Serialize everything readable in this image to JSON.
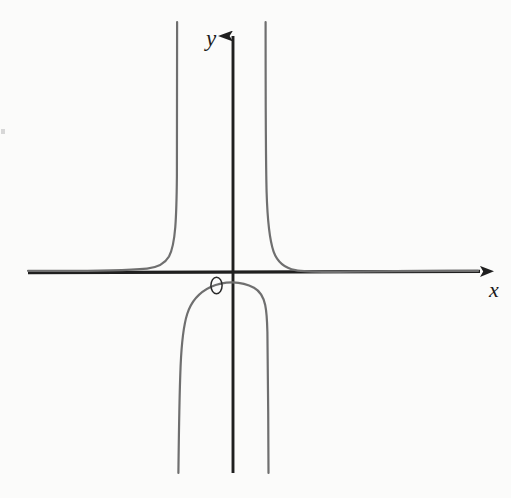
{
  "figure": {
    "background_color": "#fbfbfa",
    "axis_color": "#1f1f1f",
    "curve_color": "#6f6f6f",
    "label_color": "#1c1c1c",
    "width": 511,
    "height": 498
  },
  "labels": {
    "x_axis": "x",
    "y_axis": "y",
    "origin": "O"
  },
  "chart_data": {
    "type": "line",
    "title": "",
    "subtitle": "",
    "xlabel": "x",
    "ylabel": "y",
    "legend": [],
    "legend_position": "none",
    "grid": false,
    "annotations": [
      "O"
    ],
    "axes": {
      "x_axis_y_pixel": 272,
      "y_axis_x_pixel": 233,
      "x_axis_start_pixel": 28,
      "x_axis_end_pixel": 488,
      "y_axis_top_pixel": 22,
      "y_axis_bottom_pixel": 473,
      "x_arrow": "right",
      "y_arrow": "up",
      "xlim": [
        -5.2,
        3.1
      ],
      "ylim": [
        -3.6,
        3.1
      ],
      "origin_pixel": [
        233,
        272
      ]
    },
    "asymptotes": {
      "vertical": [
        -1.0,
        0.55
      ],
      "vertical_pixels": [
        177,
        266
      ],
      "horizontal": [
        0.0
      ],
      "horizontal_pixels": [
        272
      ]
    },
    "branches": [
      {
        "name": "left-outer-branch",
        "region": "x < left asymptote",
        "points_pixel": [
          [
            28,
            271
          ],
          [
            70,
            271
          ],
          [
            110,
            270
          ],
          [
            140,
            269
          ],
          [
            156,
            267
          ],
          [
            164,
            263
          ],
          [
            169,
            256
          ],
          [
            172,
            244
          ],
          [
            174,
            226
          ],
          [
            175.5,
            196
          ],
          [
            176.5,
            150
          ],
          [
            177,
            95
          ],
          [
            177,
            22
          ]
        ]
      },
      {
        "name": "middle-branch",
        "region": "between the two vertical asymptotes",
        "points_pixel": [
          [
            178,
            473
          ],
          [
            180,
            420
          ],
          [
            181,
            380
          ],
          [
            182,
            350
          ],
          [
            184,
            330
          ],
          [
            188,
            312
          ],
          [
            195,
            299
          ],
          [
            205,
            290
          ],
          [
            216,
            285
          ],
          [
            228,
            283
          ],
          [
            240,
            284
          ],
          [
            251,
            289
          ],
          [
            259,
            298
          ],
          [
            263,
            311
          ],
          [
            265,
            330
          ],
          [
            266,
            360
          ],
          [
            266.5,
            410
          ],
          [
            267,
            473
          ]
        ]
      },
      {
        "name": "right-outer-branch",
        "region": "x > right asymptote",
        "points_pixel": [
          [
            266,
            22
          ],
          [
            266,
            100
          ],
          [
            266.5,
            155
          ],
          [
            268,
            200
          ],
          [
            270,
            225
          ],
          [
            273,
            242
          ],
          [
            279,
            254
          ],
          [
            288,
            263
          ],
          [
            300,
            268
          ],
          [
            320,
            270
          ],
          [
            350,
            271
          ],
          [
            400,
            271
          ],
          [
            460,
            271
          ],
          [
            486,
            271
          ]
        ]
      }
    ]
  }
}
